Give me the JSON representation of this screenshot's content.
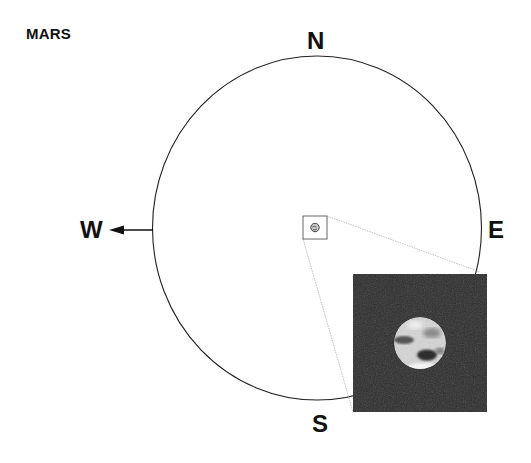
{
  "title": "MARS",
  "compass": {
    "north": "N",
    "south": "S",
    "east": "E",
    "west": "W"
  },
  "elements": {
    "sky_circle": {
      "cx": 317,
      "cy": 228,
      "rx": 164.5,
      "ry": 172,
      "stroke": "#222222"
    },
    "west_arrow": {
      "from_x": 153,
      "to_x": 110,
      "y": 230
    },
    "finder_box": {
      "x": 303,
      "y": 216,
      "width": 24,
      "height": 23,
      "stroke": "#555555"
    },
    "inset_image": {
      "x": 353,
      "y": 274,
      "width": 134,
      "height": 138,
      "background": "#2b2b2b"
    },
    "planet_disc": {
      "cx": 420,
      "cy": 343,
      "r": 26,
      "color": "#d8d8d8"
    },
    "icons": [
      "mars-planet-icon",
      "west-arrow-icon"
    ]
  }
}
